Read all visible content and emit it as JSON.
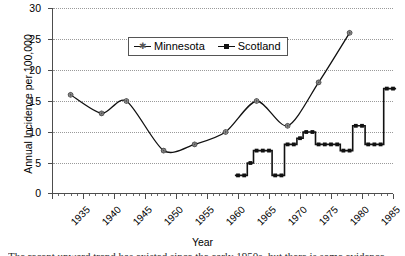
{
  "chart_data": {
    "type": "line",
    "title": "",
    "xlabel": "Year",
    "ylabel": "Annual Incidence per 100,000",
    "xlim": [
      1935,
      1990
    ],
    "ylim": [
      0,
      30
    ],
    "ytick_step": 5,
    "xtick_step": 5,
    "xminor_step": 1,
    "grid": "horizontal-dotted",
    "legend_position": "upper-left-inside",
    "ytick_labels": [
      "0",
      "5",
      "10",
      "15",
      "20",
      "25",
      "30"
    ],
    "xtick_labels": [
      "1935",
      "1940",
      "1945",
      "1950",
      "1955",
      "1960",
      "1965",
      "1970",
      "1975",
      "1980",
      "1985",
      "1990"
    ],
    "series": [
      {
        "name": "Minnesota",
        "marker": "star",
        "line": "smooth",
        "color": "#111111",
        "points": [
          {
            "x": 1938,
            "y": 16
          },
          {
            "x": 1943,
            "y": 13
          },
          {
            "x": 1947,
            "y": 15
          },
          {
            "x": 1953,
            "y": 7
          },
          {
            "x": 1958,
            "y": 8
          },
          {
            "x": 1963,
            "y": 10
          },
          {
            "x": 1968,
            "y": 15
          },
          {
            "x": 1973,
            "y": 11
          },
          {
            "x": 1978,
            "y": 18
          },
          {
            "x": 1983,
            "y": 26
          }
        ]
      },
      {
        "name": "Scotland",
        "marker": "square",
        "line": "step",
        "color": "#111111",
        "points": [
          {
            "x": 1965,
            "y": 3
          },
          {
            "x": 1966,
            "y": 3
          },
          {
            "x": 1967,
            "y": 5
          },
          {
            "x": 1968,
            "y": 7
          },
          {
            "x": 1969,
            "y": 7
          },
          {
            "x": 1970,
            "y": 7
          },
          {
            "x": 1971,
            "y": 3
          },
          {
            "x": 1972,
            "y": 3
          },
          {
            "x": 1973,
            "y": 8
          },
          {
            "x": 1974,
            "y": 8
          },
          {
            "x": 1975,
            "y": 9
          },
          {
            "x": 1976,
            "y": 10
          },
          {
            "x": 1977,
            "y": 10
          },
          {
            "x": 1978,
            "y": 8
          },
          {
            "x": 1979,
            "y": 8
          },
          {
            "x": 1980,
            "y": 8
          },
          {
            "x": 1981,
            "y": 8
          },
          {
            "x": 1982,
            "y": 7
          },
          {
            "x": 1983,
            "y": 7
          },
          {
            "x": 1984,
            "y": 11
          },
          {
            "x": 1985,
            "y": 11
          },
          {
            "x": 1986,
            "y": 8
          },
          {
            "x": 1987,
            "y": 8
          },
          {
            "x": 1988,
            "y": 8
          },
          {
            "x": 1989,
            "y": 17
          },
          {
            "x": 1990,
            "y": 17
          }
        ]
      }
    ]
  },
  "legend": {
    "items": [
      {
        "label": "Minnesota"
      },
      {
        "label": "Scotland"
      }
    ]
  },
  "caption": {
    "text": "The recent upward trend has existed since the early 1950s, but there is some evidence"
  }
}
